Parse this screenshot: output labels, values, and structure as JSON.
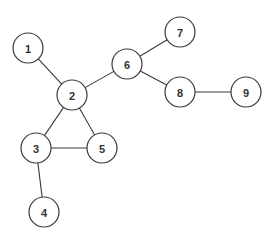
{
  "diagram": {
    "type": "undirected-graph",
    "colors": {
      "stroke": "#3a3a3a",
      "node_fill": "#ffffff",
      "label": "#333333",
      "background": "#ffffff"
    },
    "node_radius": 15,
    "nodes": [
      {
        "id": "1",
        "label": "1",
        "x": 28,
        "y": 48
      },
      {
        "id": "2",
        "label": "2",
        "x": 72,
        "y": 95
      },
      {
        "id": "3",
        "label": "3",
        "x": 36,
        "y": 148
      },
      {
        "id": "4",
        "label": "4",
        "x": 44,
        "y": 212
      },
      {
        "id": "5",
        "label": "5",
        "x": 102,
        "y": 148
      },
      {
        "id": "6",
        "label": "6",
        "x": 127,
        "y": 64
      },
      {
        "id": "7",
        "label": "7",
        "x": 180,
        "y": 32
      },
      {
        "id": "8",
        "label": "8",
        "x": 180,
        "y": 92
      },
      {
        "id": "9",
        "label": "9",
        "x": 246,
        "y": 92
      }
    ],
    "edges": [
      {
        "from": "1",
        "to": "2"
      },
      {
        "from": "2",
        "to": "6"
      },
      {
        "from": "2",
        "to": "3"
      },
      {
        "from": "2",
        "to": "5"
      },
      {
        "from": "3",
        "to": "5"
      },
      {
        "from": "3",
        "to": "4"
      },
      {
        "from": "6",
        "to": "7"
      },
      {
        "from": "6",
        "to": "8"
      },
      {
        "from": "8",
        "to": "9"
      }
    ]
  }
}
